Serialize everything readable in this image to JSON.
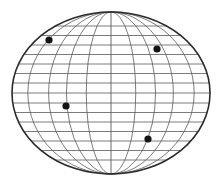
{
  "diagram": {
    "type": "globe-grid-ellipse",
    "width": 221,
    "height": 184,
    "ellipse": {
      "cx": 111,
      "cy": 93,
      "rx": 99,
      "ry": 81
    },
    "meridian_ratios": [
      0.25,
      0.45,
      0.63,
      0.84
    ],
    "parallel_offsets": [
      -67,
      -57.5,
      -48,
      -38.5,
      -29,
      -19.5,
      -10,
      0,
      10,
      19.5,
      29,
      38.5,
      48,
      57.5,
      67
    ],
    "points": [
      {
        "id": "point-1",
        "x": 49,
        "y": 40
      },
      {
        "id": "point-2",
        "x": 157,
        "y": 49
      },
      {
        "id": "point-3",
        "x": 66,
        "y": 106
      },
      {
        "id": "point-4",
        "x": 148,
        "y": 139
      }
    ],
    "colors": {
      "background": "#ffffff",
      "outline": "#2b2b2b",
      "grid": "#5a5a5a",
      "point": "#141414"
    },
    "point_radius": 3.6
  }
}
